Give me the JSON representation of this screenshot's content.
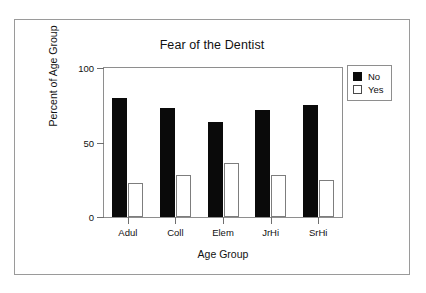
{
  "chart_data": {
    "type": "bar",
    "title": "Fear of the Dentist",
    "xlabel": "Age Group",
    "ylabel": "Percent of Age Group",
    "categories": [
      "Adul",
      "Coll",
      "Elem",
      "JrHi",
      "SrHi"
    ],
    "series": [
      {
        "name": "No",
        "color": "#0a0a0a",
        "fill": "solid",
        "values": [
          80,
          73,
          64,
          72,
          75
        ]
      },
      {
        "name": "Yes",
        "color": "#ffffff",
        "fill": "outline",
        "values": [
          23,
          28,
          36,
          28,
          25
        ]
      }
    ],
    "ylim": [
      0,
      100
    ],
    "yticks": [
      0,
      50,
      100
    ],
    "ytick_labels": [
      "0",
      "50",
      "100"
    ],
    "grid": false,
    "legend_position": "top-right",
    "legend_entries": [
      "No",
      "Yes"
    ]
  },
  "figure": {
    "frame_color": "#9a9a9a",
    "background": "#ffffff"
  }
}
